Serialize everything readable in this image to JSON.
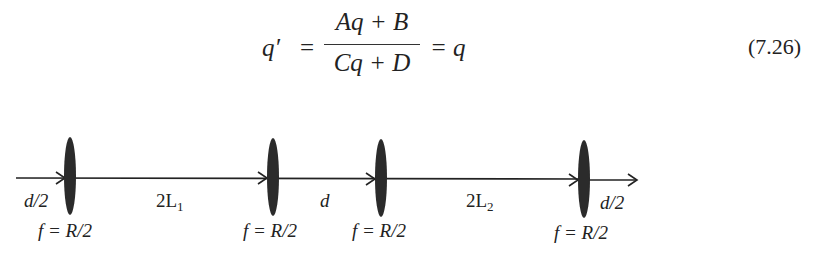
{
  "equation": {
    "lhs": "q′",
    "equals": "=",
    "numerator": "Aq + B",
    "denominator": "Cq + D",
    "rhs": "= q",
    "number": "(7.26)"
  },
  "diagram": {
    "segments": [
      {
        "label": "d/2"
      },
      {
        "label": "2L",
        "sub": "1"
      },
      {
        "label": "d"
      },
      {
        "label": "2L",
        "sub": "2"
      },
      {
        "label": "d/2"
      }
    ],
    "lenses": [
      {
        "label": "f = R/2"
      },
      {
        "label": "f = R/2"
      },
      {
        "label": "f = R/2"
      },
      {
        "label": "f = R/2"
      }
    ],
    "colors": {
      "lens": "#2b2b2b",
      "line": "#222222"
    }
  }
}
